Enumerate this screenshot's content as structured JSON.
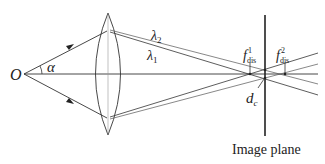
{
  "diagram": {
    "labels": {
      "origin": "O",
      "angle": "α",
      "lambda2": "λ",
      "lambda2_sub": "2",
      "lambda1": "λ",
      "lambda1_sub": "1",
      "focus1_main": "f",
      "focus1_sup": "1",
      "focus1_sub": "dis",
      "focus2_main": "f",
      "focus2_sup": "2",
      "focus2_sub": "dis",
      "dc_main": "d",
      "dc_sub": "c",
      "image_plane": "Image plane"
    },
    "colors": {
      "line": "#333333",
      "text": "#222222",
      "background": "#ffffff"
    }
  }
}
